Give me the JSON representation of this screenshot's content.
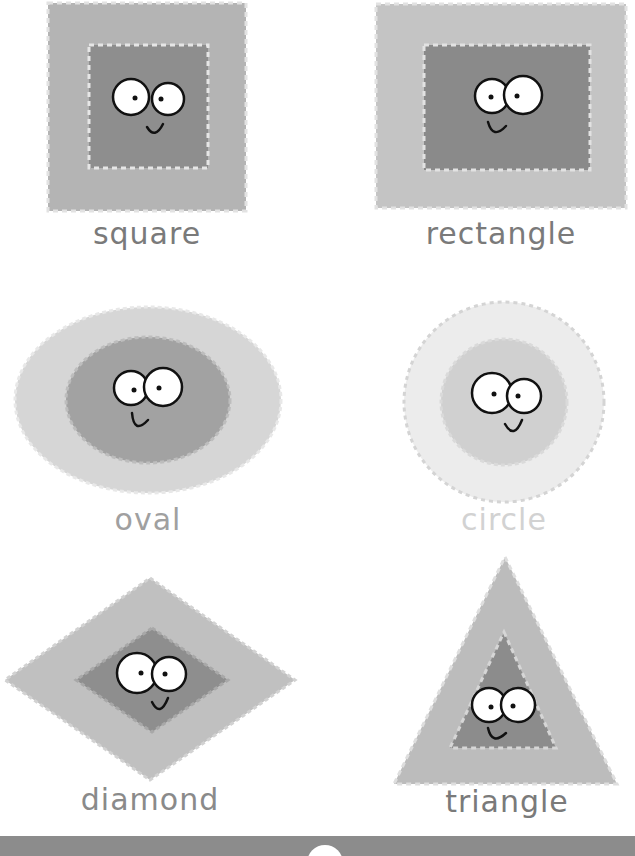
{
  "colors": {
    "background": "#ffffff",
    "face_outline": "#111111",
    "eye_fill": "#ffffff",
    "bottom_band": "#8c8c8c"
  },
  "shapes": [
    {
      "id": "square",
      "label": "square",
      "outer_color": "#b4b4b4",
      "inner_color": "#8e8e8e",
      "label_color": "#7a7a7a"
    },
    {
      "id": "rectangle",
      "label": "rectangle",
      "outer_color": "#c4c4c4",
      "inner_color": "#8a8a8a",
      "label_color": "#7a7a7a"
    },
    {
      "id": "oval",
      "label": "oval",
      "outer_color": "#d6d6d6",
      "inner_color": "#a2a2a2",
      "label_color": "#a0a0a0"
    },
    {
      "id": "circle",
      "label": "circle",
      "outer_color": "#ececec",
      "inner_color": "#d0d0d0",
      "label_color": "#d2d2d2"
    },
    {
      "id": "diamond",
      "label": "diamond",
      "outer_color": "#c0c0c0",
      "inner_color": "#8e8e8e",
      "label_color": "#8a8a8a"
    },
    {
      "id": "triangle",
      "label": "triangle",
      "outer_color": "#bcbcbc",
      "inner_color": "#8c8c8c",
      "label_color": "#7a7a7a"
    }
  ]
}
